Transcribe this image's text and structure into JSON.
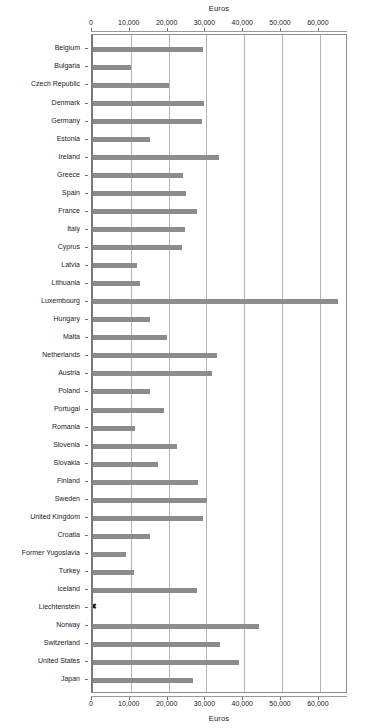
{
  "chart_data": {
    "type": "bar",
    "orientation": "horizontal",
    "title": "",
    "xlabel": "Euros",
    "ylabel": "",
    "top_axis_label": "Euros",
    "bottom_axis_label": "Euros",
    "xlim": [
      0,
      67700
    ],
    "xticks": [
      0,
      10000,
      20000,
      30000,
      40000,
      50000,
      60000
    ],
    "xtick_labels": [
      "0",
      "10,000",
      "20,000",
      "30,000",
      "40,000",
      "50,000",
      "60,000"
    ],
    "grid": "vertical",
    "legend": "none",
    "bar_color": "#8c8c8c",
    "nodata_marker": "✖",
    "nodata_note": "Liechtenstein has no bar; an X marker sits at the zero axis",
    "categories": [
      "Belgium",
      "Bulgaria",
      "Czech Republic",
      "Denmark",
      "Germany",
      "Estonia",
      "Ireland",
      "Greece",
      "Spain",
      "France",
      "Italy",
      "Cyprus",
      "Latvia",
      "Lithuania",
      "Luxembourg",
      "Hungary",
      "Malta",
      "Netherlands",
      "Austria",
      "Poland",
      "Portugal",
      "Romania",
      "Slovenia",
      "Slovakia",
      "Finland",
      "Sweden",
      "United Kingdom",
      "Croatia",
      "Former Yugoslavia",
      "Turkey",
      "Iceland",
      "Liechtenstein",
      "Norway",
      "Switzerland",
      "United States",
      "Japan"
    ],
    "values": [
      29200,
      10000,
      20200,
      29400,
      28900,
      15000,
      33200,
      23900,
      24600,
      27400,
      24300,
      23500,
      11700,
      12400,
      64800,
      15200,
      19500,
      32700,
      31400,
      15000,
      18800,
      11100,
      22100,
      17300,
      27700,
      30100,
      29000,
      15200,
      8700,
      10900,
      27400,
      null,
      44000,
      33600,
      38500,
      26500
    ]
  }
}
